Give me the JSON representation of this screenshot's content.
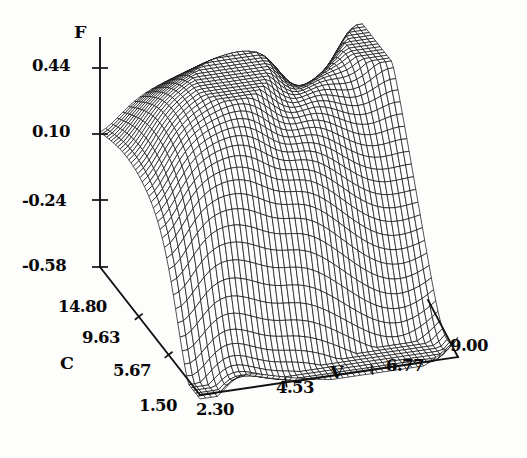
{
  "figure": {
    "background_color": "#fdfdfc",
    "ink_color": "#101010",
    "style": "scanned-wireframe-surface"
  },
  "axes": {
    "vertical": {
      "name": "F",
      "label": "F",
      "ticks": [
        "0.44",
        "0.10",
        "-0.24",
        "-0.58"
      ],
      "tick_values": [
        0.44,
        0.1,
        -0.24,
        -0.58
      ],
      "range": [
        -0.58,
        0.44
      ]
    },
    "depth": {
      "name": "C",
      "label": "C",
      "ticks": [
        "14.80",
        "9.63",
        "5.67",
        "1.50"
      ],
      "tick_values": [
        14.8,
        9.63,
        5.67,
        1.5
      ],
      "range": [
        1.5,
        14.8
      ]
    },
    "width": {
      "name": "V",
      "label": "V",
      "ticks": [
        "2.30",
        "4.53",
        "6.77",
        "9.00"
      ],
      "tick_values": [
        2.3,
        4.53,
        6.77,
        9.0
      ],
      "range": [
        2.3,
        9.0
      ]
    }
  },
  "chart_data": {
    "type": "surface",
    "title": "",
    "xlabel": "V",
    "ylabel": "C",
    "zlabel": "F",
    "xlim": [
      2.3,
      9.0
    ],
    "ylim": [
      1.5,
      14.8
    ],
    "zlim": [
      -0.58,
      0.44
    ],
    "grid": false,
    "legend": "none",
    "xticks": [
      2.3,
      4.53,
      6.77,
      9.0
    ],
    "yticks": [
      1.5,
      5.67,
      9.63,
      14.8
    ],
    "zticks": [
      -0.58,
      -0.24,
      0.1,
      0.44
    ],
    "mesh": {
      "nx": 46,
      "ny": 46,
      "description": "Dense wireframe mesh surface with a broad central dome rising to about F = 0.44, a dark diagonal crease on the upper right, a deep valley near the front-bottom reaching about F = -0.58, and an upturned flare at the far right corner."
    },
    "surface_features": [
      {
        "feature": "central-dome-peak",
        "F": 0.44
      },
      {
        "feature": "right-crease-fold",
        "F": 0.1
      },
      {
        "feature": "front-valley-trough",
        "F": -0.58
      },
      {
        "feature": "right-corner-flare",
        "F": 0.1
      }
    ]
  },
  "labels": {
    "f_axis": "F",
    "c_axis": "C",
    "v_axis": "V",
    "f_tick_0": "0.44",
    "f_tick_1": "0.10",
    "f_tick_2": "-0.24",
    "f_tick_3": "-0.58",
    "c_tick_0": "14.80",
    "c_tick_1": "9.63",
    "c_tick_2": "5.67",
    "c_tick_3": "1.50",
    "v_tick_0": "2.30",
    "v_tick_1": "4.53",
    "v_tick_2": "6.77",
    "v_tick_3": "9.00"
  }
}
